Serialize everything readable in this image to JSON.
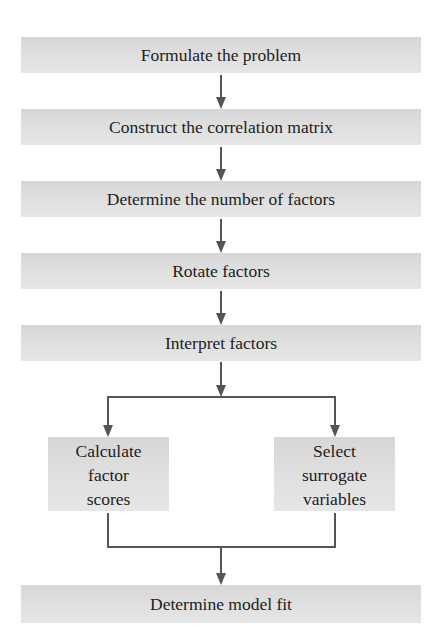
{
  "diagram": {
    "type": "flowchart",
    "steps": [
      {
        "id": "formulate",
        "label": "Formulate the problem"
      },
      {
        "id": "correlation",
        "label": "Construct the correlation matrix"
      },
      {
        "id": "num_factors",
        "label": "Determine the number of factors"
      },
      {
        "id": "rotate",
        "label": "Rotate factors"
      },
      {
        "id": "interpret",
        "label": "Interpret factors"
      }
    ],
    "branches": [
      {
        "id": "factor_scores",
        "lines": [
          "Calculate",
          "factor",
          "scores"
        ]
      },
      {
        "id": "surrogate",
        "lines": [
          "Select",
          "surrogate",
          "variables"
        ]
      }
    ],
    "final": {
      "id": "model_fit",
      "label": "Determine model fit"
    },
    "colors": {
      "box_fill": "#dcdcdc",
      "arrow": "#555555",
      "text": "#222222"
    }
  }
}
